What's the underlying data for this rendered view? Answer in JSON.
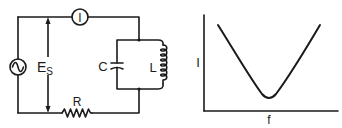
{
  "circuit": {
    "ammeter_label": "I",
    "source_voltage_label": "E",
    "source_voltage_subscript": "S",
    "capacitor_label": "C",
    "inductor_label": "L",
    "resistor_label": "R",
    "source_symbol": "AC source (~)"
  },
  "graph": {
    "ylabel": "I",
    "xlabel": "f",
    "curve_shape": "V-shaped dip (parallel resonance minimum)"
  },
  "colors": {
    "ink": "#1a1a1a",
    "background": "#ffffff"
  }
}
